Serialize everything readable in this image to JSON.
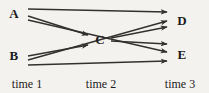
{
  "figure": {
    "background_color": "#f4f2ef",
    "line_color": "#333130",
    "text_color": "#1c1c1c"
  },
  "nodes": [
    {
      "id": "A",
      "label": "A",
      "x": 14,
      "y": 13,
      "column": 1
    },
    {
      "id": "B",
      "label": "B",
      "x": 14,
      "y": 55,
      "column": 1
    },
    {
      "id": "C",
      "label": "C",
      "x": 100,
      "y": 39,
      "column": 2
    },
    {
      "id": "D",
      "label": "D",
      "x": 182,
      "y": 20,
      "column": 3
    },
    {
      "id": "E",
      "label": "E",
      "x": 182,
      "y": 54,
      "column": 3
    }
  ],
  "edges": [
    {
      "id": "a-d",
      "from": "A",
      "to": "D",
      "x1": 28,
      "y1": 9,
      "x2": 167,
      "y2": 12
    },
    {
      "id": "a-c",
      "from": "A",
      "to": "C",
      "x1": 28,
      "y1": 16,
      "x2": 88,
      "y2": 35
    },
    {
      "id": "a-e",
      "from": "A",
      "to": "E",
      "x1": 28,
      "y1": 20,
      "x2": 167,
      "y2": 52
    },
    {
      "id": "b-c",
      "from": "B",
      "to": "C",
      "x1": 28,
      "y1": 56,
      "x2": 88,
      "y2": 45
    },
    {
      "id": "b-d",
      "from": "B",
      "to": "D",
      "x1": 28,
      "y1": 60,
      "x2": 167,
      "y2": 21
    },
    {
      "id": "b-e",
      "from": "B",
      "to": "E",
      "x1": 28,
      "y1": 65,
      "x2": 167,
      "y2": 61
    },
    {
      "id": "c-d",
      "from": "C",
      "to": "D",
      "x1": 111,
      "y1": 38,
      "x2": 167,
      "y2": 27
    },
    {
      "id": "c-e",
      "from": "C",
      "to": "E",
      "x1": 111,
      "y1": 41,
      "x2": 167,
      "y2": 44
    }
  ],
  "time_labels": [
    {
      "id": "time-1",
      "label": "time 1",
      "x": 27,
      "y": 84
    },
    {
      "id": "time-2",
      "label": "time 2",
      "x": 101,
      "y": 84
    },
    {
      "id": "time-3",
      "label": "time 3",
      "x": 180,
      "y": 84
    }
  ]
}
